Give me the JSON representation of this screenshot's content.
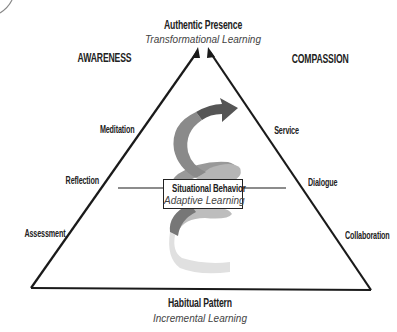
{
  "diagram": {
    "apex": {
      "title": "Authentic Presence",
      "subtitle": "Transformational Learning"
    },
    "center": {
      "title": "Situational Behavior",
      "subtitle": "Adaptive Learning"
    },
    "base": {
      "title": "Habitual Pattern",
      "subtitle": "Incremental Learning"
    },
    "left_side": {
      "heading": "AWARENESS",
      "practices": [
        "Meditation",
        "Reflection",
        "Assessment"
      ]
    },
    "right_side": {
      "heading": "COMPASSION",
      "practices": [
        "Service",
        "Dialogue",
        "Collaboration"
      ]
    },
    "colors": {
      "line": "#1a1a1a",
      "spiral_dark": "#555555",
      "spiral_mid": "#8a8a8a",
      "spiral_light": "#c8c8c8",
      "spiral_faint": "#e2e2e2"
    }
  }
}
